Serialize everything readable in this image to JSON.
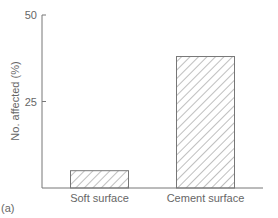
{
  "chart_data": {
    "type": "bar",
    "title": "",
    "xlabel": "",
    "ylabel": "No. affected (%)",
    "ylim": [
      0,
      50
    ],
    "yticks": [
      25,
      50
    ],
    "ytick_labels": [
      "25",
      "50"
    ],
    "categories": [
      "Soft surface",
      "Cement surface"
    ],
    "values": [
      5,
      38
    ],
    "bar_fill": "hatched",
    "grid": false,
    "legend": "none",
    "panel_label": "(a)",
    "colors": {
      "axis": "#777777",
      "text": "#666666",
      "hatch": "#888888"
    }
  }
}
